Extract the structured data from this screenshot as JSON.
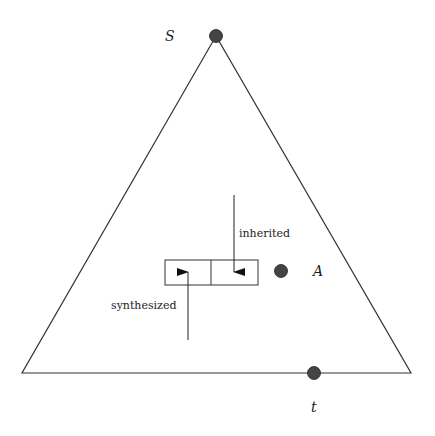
{
  "diagram": {
    "type": "parse-tree attribute flow",
    "nodes": {
      "root": {
        "label": "S",
        "x": 216,
        "y": 36
      },
      "leaf": {
        "label": "t",
        "x": 314,
        "y": 373
      },
      "inner": {
        "label": "A",
        "x": 281,
        "y": 271
      }
    },
    "triangle": {
      "apex": [
        216,
        36
      ],
      "base_left": [
        22,
        373
      ],
      "base_right": [
        411,
        373
      ]
    },
    "attribute_box": {
      "x": 165,
      "y": 260,
      "width": 93,
      "height": 25,
      "divider_x": 211
    },
    "arrows": {
      "inherited": {
        "label": "inherited",
        "from": [
          234,
          195
        ],
        "to": [
          234,
          272
        ]
      },
      "synthesized": {
        "label": "synthesized",
        "from": [
          188,
          340
        ],
        "to": [
          188,
          272
        ]
      }
    },
    "colors": {
      "node": "#444444",
      "line": "#333333"
    }
  }
}
